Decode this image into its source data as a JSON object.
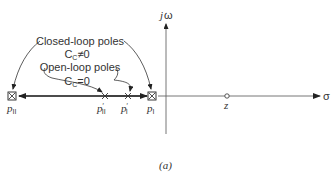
{
  "figure": {
    "caption": "(a)",
    "axes": {
      "imag_label_j": "j",
      "imag_label_omega": "ω",
      "real_label": "σ"
    },
    "annotations": {
      "closed_loop_title": "Closed-loop poles",
      "closed_loop_condition_C": "C",
      "closed_loop_condition_sub": "C",
      "closed_loop_condition_rel": "≠0",
      "open_loop_title": "Open-loop poles",
      "open_loop_condition_C": "C",
      "open_loop_condition_sub": "C",
      "open_loop_condition_rel": "=0"
    },
    "points": [
      {
        "id": "p_II",
        "symbol": "boxed-x",
        "label": "p",
        "sub": "II",
        "prime": ""
      },
      {
        "id": "p_prime_II",
        "symbol": "x",
        "label": "p",
        "sub": "II",
        "prime": "′"
      },
      {
        "id": "p_prime_I",
        "symbol": "x",
        "label": "p",
        "sub": "I",
        "prime": "′"
      },
      {
        "id": "p_I",
        "symbol": "boxed-x",
        "label": "p",
        "sub": "I",
        "prime": ""
      },
      {
        "id": "z",
        "symbol": "circle",
        "label": "z",
        "sub": "",
        "prime": ""
      }
    ],
    "colors": {
      "stroke": "#333333",
      "axis": "#555555"
    }
  }
}
